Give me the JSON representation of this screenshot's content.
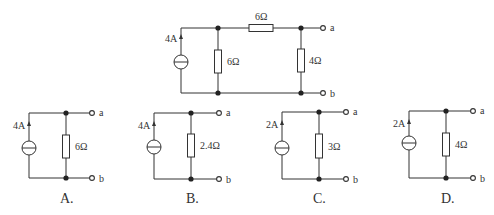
{
  "main_circuit": {
    "source_label": "4A",
    "shunt_resistor_label": "6Ω",
    "series_resistor_label": "6Ω",
    "output_resistor_label": "4Ω",
    "terminal_a": "a",
    "terminal_b": "b"
  },
  "options": [
    {
      "label": "A.",
      "source_label": "4A",
      "resistor_label": "6Ω",
      "terminal_a": "a",
      "terminal_b": "b"
    },
    {
      "label": "B.",
      "source_label": "4A",
      "resistor_label": "2.4Ω",
      "terminal_a": "a",
      "terminal_b": "b"
    },
    {
      "label": "C.",
      "source_label": "2A",
      "resistor_label": "3Ω",
      "terminal_a": "a",
      "terminal_b": "b"
    },
    {
      "label": "D.",
      "source_label": "2A",
      "resistor_label": "4Ω",
      "terminal_a": "a",
      "terminal_b": "b"
    }
  ],
  "colors": {
    "line": "#333333",
    "background": "#ffffff"
  }
}
